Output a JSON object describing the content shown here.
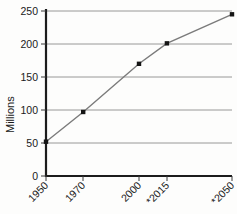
{
  "chart_data": {
    "type": "line",
    "title": "",
    "xlabel": "",
    "ylabel": "Millions",
    "categories": [
      "1950",
      "1970",
      "2000",
      "*2015",
      "*2050"
    ],
    "x": [
      1950,
      1970,
      2000,
      2015,
      2050
    ],
    "values": [
      52,
      97,
      170,
      201,
      245
    ],
    "series": [
      {
        "name": "Population",
        "values": [
          52,
          97,
          170,
          201,
          245
        ]
      }
    ],
    "ylim": [
      0,
      250
    ],
    "xlim": [
      1950,
      2050
    ],
    "yticks": [
      0,
      50,
      100,
      150,
      200,
      250
    ],
    "ytick_labels": [
      "0",
      "50",
      "100",
      "150",
      "200",
      "250"
    ],
    "xtick_labels": [
      "1950",
      "1970",
      "2000",
      "*2015",
      "*2050"
    ],
    "grid": "horizontal",
    "gridline_values": [
      50,
      100,
      150,
      200,
      250
    ],
    "legend": "none",
    "marker": "square",
    "colors": {
      "line": "#7b7b7b",
      "marker": "#141414",
      "gridline": "#8d8d8d",
      "axis": "#1c1c1c",
      "text": "#1a1a1a",
      "background": "#fdfdfc"
    },
    "xtick_rotation": -45
  },
  "axis": {
    "y_title": "Millions"
  }
}
